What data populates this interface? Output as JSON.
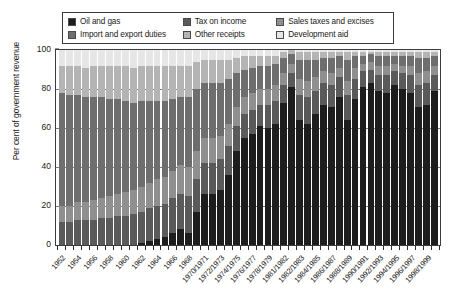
{
  "chart_data": {
    "type": "bar",
    "stacked": true,
    "title": "",
    "xlabel": "",
    "ylabel": "Per cent of government revenue",
    "ylim": [
      0,
      100
    ],
    "yticks": [
      0,
      20,
      40,
      60,
      80,
      100
    ],
    "grid": true,
    "legend_position": "top",
    "series": [
      {
        "name": "Oil and gas",
        "color": "#1d1d1d",
        "values": [
          0,
          0,
          0,
          0,
          0,
          0,
          0,
          0,
          0,
          0,
          1,
          2,
          3,
          4,
          6,
          8,
          6,
          17,
          26,
          26,
          28,
          36,
          48,
          55,
          57,
          61,
          60,
          62,
          73,
          81,
          64,
          62,
          67,
          72,
          71,
          76,
          64,
          75,
          81,
          83,
          79,
          78,
          82,
          80,
          78,
          71,
          72,
          79
        ]
      },
      {
        "name": "Tax on income",
        "color": "#5a5a5a",
        "values": [
          12,
          12,
          13,
          13,
          13,
          14,
          14,
          15,
          15,
          16,
          16,
          17,
          17,
          17,
          18,
          18,
          19,
          17,
          16,
          16,
          16,
          15,
          13,
          12,
          12,
          11,
          12,
          12,
          9,
          7,
          13,
          14,
          12,
          11,
          11,
          10,
          13,
          10,
          8,
          7,
          8,
          9,
          7,
          8,
          9,
          11,
          11,
          8
        ]
      },
      {
        "name": "Sales taxes and excises",
        "color": "#8f8f8f",
        "values": [
          8,
          8,
          9,
          9,
          10,
          10,
          11,
          11,
          12,
          12,
          13,
          13,
          14,
          14,
          14,
          15,
          15,
          14,
          13,
          13,
          12,
          11,
          10,
          9,
          9,
          8,
          8,
          8,
          6,
          5,
          8,
          8,
          7,
          6,
          6,
          5,
          7,
          6,
          4,
          4,
          5,
          5,
          4,
          4,
          5,
          6,
          6,
          5
        ]
      },
      {
        "name": "Import and export duties",
        "color": "#6e6e6e",
        "values": [
          58,
          57,
          55,
          54,
          53,
          52,
          50,
          49,
          47,
          45,
          44,
          42,
          40,
          39,
          37,
          35,
          36,
          32,
          28,
          28,
          27,
          23,
          17,
          14,
          13,
          12,
          12,
          11,
          8,
          5,
          10,
          11,
          9,
          7,
          8,
          6,
          11,
          6,
          4,
          4,
          5,
          5,
          4,
          5,
          5,
          8,
          7,
          5
        ]
      },
      {
        "name": "Other receipts",
        "color": "#b4b4b4",
        "values": [
          14,
          15,
          15,
          15,
          16,
          16,
          17,
          17,
          18,
          18,
          18,
          18,
          18,
          18,
          17,
          16,
          16,
          14,
          12,
          12,
          12,
          10,
          8,
          7,
          6,
          5,
          5,
          4,
          3,
          2,
          4,
          4,
          4,
          3,
          3,
          2,
          4,
          2,
          2,
          1,
          2,
          2,
          2,
          2,
          2,
          3,
          3,
          2
        ]
      },
      {
        "name": "Development aid",
        "color": "#e6e6e6",
        "values": [
          8,
          8,
          8,
          9,
          8,
          8,
          8,
          8,
          8,
          9,
          8,
          8,
          8,
          8,
          8,
          8,
          8,
          6,
          5,
          5,
          5,
          5,
          4,
          3,
          3,
          3,
          3,
          3,
          1,
          0,
          1,
          1,
          1,
          1,
          1,
          1,
          1,
          1,
          1,
          1,
          1,
          1,
          1,
          1,
          1,
          1,
          1,
          1
        ]
      }
    ],
    "categories": [
      "1952",
      "1953",
      "1954",
      "1955",
      "1956",
      "1957",
      "1958",
      "1959",
      "1960",
      "1961",
      "1962",
      "1963",
      "1964",
      "1965",
      "1966",
      "1967",
      "1968",
      "1969",
      "1970/1971",
      "1971/1972",
      "1972/1973",
      "1973/1974",
      "1974/1975",
      "1975/1976",
      "1976/1977",
      "1977/1978",
      "1978/1979",
      "1979/1980",
      "1981/1982",
      "1982/1983",
      "1983/1984",
      "1984/1985",
      "1985/1986",
      "1986/1987",
      "1987/1988",
      "1988/1989",
      "1989/1990",
      "1990/1991",
      "1991/1992",
      "1992/1993",
      "1993/1994",
      "1994/1995",
      "1995/1996",
      "1996/1997",
      "1997/1998",
      "1998/1999",
      "1999/2000",
      "2000/2001"
    ],
    "tick_labels": [
      {
        "index": 0,
        "text": "1952"
      },
      {
        "index": 2,
        "text": "1954"
      },
      {
        "index": 4,
        "text": "1956"
      },
      {
        "index": 6,
        "text": "1958"
      },
      {
        "index": 8,
        "text": "1960"
      },
      {
        "index": 10,
        "text": "1962"
      },
      {
        "index": 12,
        "text": "1964"
      },
      {
        "index": 14,
        "text": "1966"
      },
      {
        "index": 16,
        "text": "1968"
      },
      {
        "index": 18,
        "text": "1970/1971"
      },
      {
        "index": 20,
        "text": "1972/1973"
      },
      {
        "index": 22,
        "text": "1974/1975"
      },
      {
        "index": 24,
        "text": "1976/1977"
      },
      {
        "index": 26,
        "text": "1978/1979"
      },
      {
        "index": 28,
        "text": "1981/1982"
      },
      {
        "index": 30,
        "text": "1982/1983"
      },
      {
        "index": 32,
        "text": "1984/1985"
      },
      {
        "index": 34,
        "text": "1986/1987"
      },
      {
        "index": 36,
        "text": "1988/1989"
      },
      {
        "index": 38,
        "text": "1990/1991"
      },
      {
        "index": 40,
        "text": "1992/1993"
      },
      {
        "index": 42,
        "text": "1994/1995"
      },
      {
        "index": 44,
        "text": "1996/1997"
      },
      {
        "index": 46,
        "text": "1998/1999"
      }
    ]
  },
  "legend": {
    "rows": [
      [
        {
          "label": "Oil and gas",
          "color": "#1d1d1d",
          "width": 112
        },
        {
          "label": "Tax on income",
          "color": "#5a5a5a",
          "width": 90
        },
        {
          "label": "Sales taxes and excises",
          "color": "#8f8f8f",
          "width": 110
        }
      ],
      [
        {
          "label": "Import and export duties",
          "color": "#6e6e6e",
          "width": 112
        },
        {
          "label": "Other receipts",
          "color": "#b4b4b4",
          "width": 90
        },
        {
          "label": "Development aid",
          "color": "#e6e6e6",
          "width": 110
        }
      ]
    ]
  }
}
